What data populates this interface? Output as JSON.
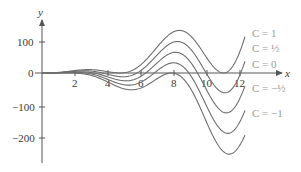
{
  "chart_data": {
    "type": "line",
    "title": "",
    "xlabel": "x",
    "ylabel": "y",
    "xlim": [
      0,
      14.3
    ],
    "ylim": [
      -280,
      160
    ],
    "grid": false,
    "x_ticks": [
      2,
      4,
      6,
      8,
      10,
      12
    ],
    "y_ticks": [
      100,
      0,
      -100,
      -200
    ],
    "x_tick_labels": [
      "2",
      "4",
      "6",
      "8",
      "10",
      "12"
    ],
    "y_tick_labels": [
      "100",
      "0",
      "−100",
      "−200"
    ],
    "legend_position": "right, inline labels at curve ends",
    "series": [
      {
        "name": "C = 1",
        "C": 1
      },
      {
        "name": "C = ½",
        "C": 0.5
      },
      {
        "name": "C = 0",
        "C": 0
      },
      {
        "name": "C = −½",
        "C": -0.5
      },
      {
        "name": "C = −1",
        "C": -1
      }
    ],
    "approx_family": "y = x^2 (sin x + C)",
    "x": [
      0,
      1,
      2,
      3,
      4,
      5,
      6,
      7,
      8,
      8.4,
      9,
      10,
      11,
      12,
      12.3
    ],
    "series_values": {
      "C = 1": [
        0,
        1.8,
        7.6,
        10.3,
        3.9,
        1.0,
        26,
        81,
        127,
        131,
        114,
        46,
        0,
        66,
        113
      ],
      "C = 1/2": [
        0,
        1.3,
        5.6,
        5.8,
        -4.1,
        -11.5,
        8,
        57,
        95,
        96,
        74,
        -4,
        -60,
        -6,
        37
      ],
      "C = 0": [
        0,
        0.8,
        3.6,
        1.3,
        -12.1,
        -24.0,
        -10,
        32,
        63,
        60,
        33,
        -54,
        -121,
        -77,
        -39
      ],
      "C = -1/2": [
        0,
        0.3,
        1.6,
        -3.2,
        -20.1,
        -36.5,
        -28,
        8,
        31,
        25,
        -7,
        -104,
        -181,
        -149,
        -114
      ],
      "C = -1": [
        0,
        -0.2,
        -0.4,
        -7.7,
        -28.1,
        -49.0,
        -46,
        -17,
        -1,
        -10,
        -48,
        -154,
        -242,
        -221,
        -190
      ]
    }
  },
  "axes": {
    "x_name": "x",
    "y_name": "y"
  },
  "labels": {
    "c1": "C = 1",
    "c_half": "C = ½",
    "c0": "C = 0",
    "c_neg_half": "C = −½",
    "c_neg1": "C = −1"
  },
  "ticks": {
    "x": [
      "2",
      "4",
      "6",
      "8",
      "10",
      "12"
    ],
    "y": [
      "100",
      "0",
      "−100",
      "−200"
    ]
  },
  "colors": {
    "curve": "#6e6e6e",
    "axis": "#555555",
    "legend": "#9a9a9a"
  }
}
